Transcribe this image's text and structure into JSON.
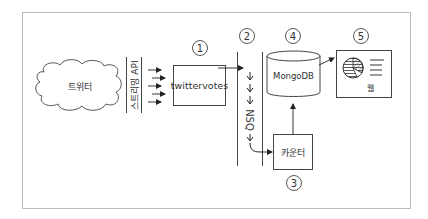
{
  "diagram": {
    "type": "architecture-flow",
    "nodes": [
      {
        "id": "twitter",
        "label": "트위터",
        "shape": "cloud"
      },
      {
        "id": "streaming_api",
        "label": "스트리밍 API",
        "shape": "vertical-band"
      },
      {
        "id": "twittervotes",
        "label": "twittervotes",
        "shape": "box",
        "number": "1"
      },
      {
        "id": "nsq",
        "label": "NSQ",
        "shape": "vertical-band",
        "number": "2"
      },
      {
        "id": "counter",
        "label": "카운터",
        "shape": "box",
        "number": "3"
      },
      {
        "id": "mongodb",
        "label": "MongoDB",
        "shape": "cylinder",
        "number": "4"
      },
      {
        "id": "web",
        "label": "웹",
        "shape": "web-page-box",
        "number": "5"
      }
    ],
    "edges": [
      {
        "from": "streaming_api",
        "to": "twittervotes",
        "style": "multiple-arrows"
      },
      {
        "from": "twittervotes",
        "to": "nsq"
      },
      {
        "from": "nsq",
        "to": "counter"
      },
      {
        "from": "counter",
        "to": "mongodb"
      },
      {
        "from": "mongodb",
        "to": "web"
      }
    ],
    "colors": {
      "line": "#333333",
      "frame": "#bbbbbb",
      "background": "#ffffff"
    }
  }
}
